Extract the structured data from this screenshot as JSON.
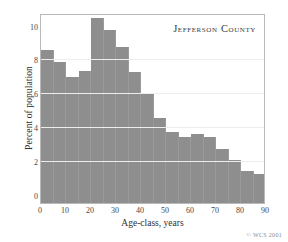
{
  "chart_data": {
    "type": "bar",
    "title": "Jefferson County",
    "xlabel": "Age-class, years",
    "ylabel": "Percent of population",
    "xlim": [
      0,
      90
    ],
    "ylim": [
      0,
      10.8
    ],
    "grid": true,
    "legend": null,
    "bin_width": 5,
    "categories": [
      "0-5",
      "5-10",
      "10-15",
      "15-20",
      "20-25",
      "25-30",
      "30-35",
      "35-40",
      "40-45",
      "45-50",
      "50-55",
      "55-60",
      "60-65",
      "65-70",
      "70-75",
      "75-80",
      "80-85",
      "85-90"
    ],
    "bin_starts": [
      0,
      5,
      10,
      15,
      20,
      25,
      30,
      35,
      40,
      45,
      50,
      55,
      60,
      65,
      70,
      75,
      80,
      85
    ],
    "values": [
      8.6,
      7.9,
      7.0,
      7.4,
      10.5,
      9.8,
      8.8,
      7.3,
      6.1,
      4.6,
      3.8,
      3.5,
      3.65,
      3.5,
      2.75,
      2.1,
      1.5,
      1.3
    ],
    "ylabel_unit": "Percent of population",
    "yticks": [
      0,
      2,
      4,
      6,
      8,
      10
    ],
    "ytick_labels": [
      "0",
      "2",
      "4",
      "6",
      "8",
      "10"
    ],
    "xticks": [
      0,
      10,
      20,
      30,
      40,
      50,
      60,
      70,
      80,
      90
    ],
    "xtick_labels": [
      "0",
      "10",
      "20",
      "30",
      "40",
      "50",
      "60",
      "70",
      "80",
      "90"
    ],
    "gridlines_at": [
      2,
      4,
      6,
      8
    ],
    "bar_color": "#8e8e8e",
    "grid_color": "#ededed",
    "frame_color": "#b9b9b9",
    "background_color": "#ffffff"
  },
  "credit": "© WCS 2001"
}
